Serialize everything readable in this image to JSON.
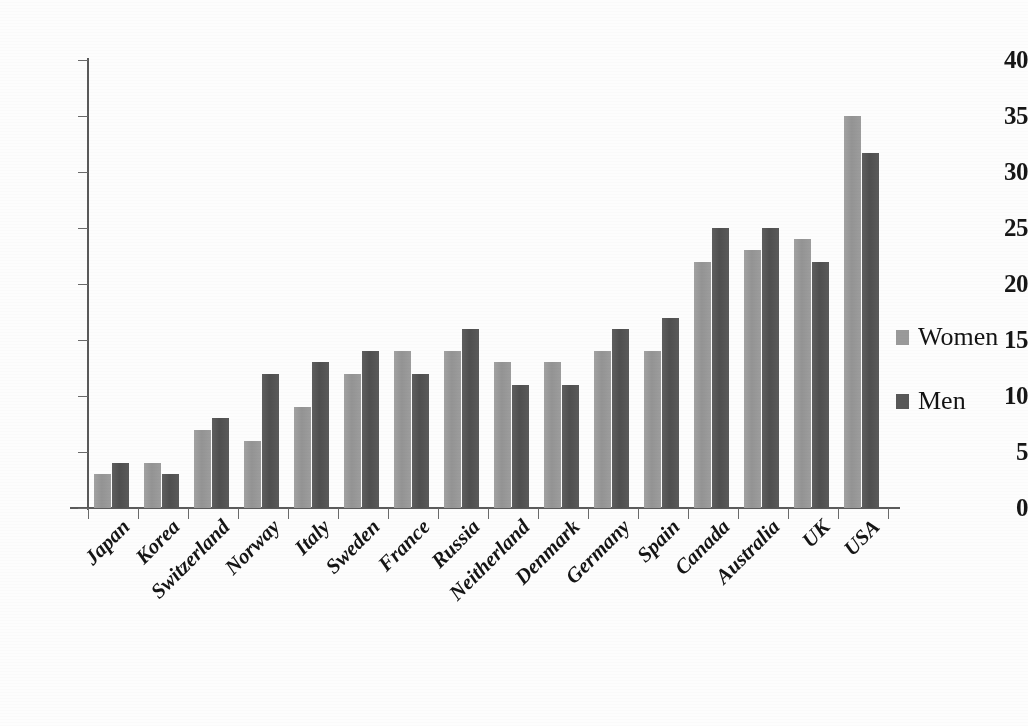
{
  "chart_data": {
    "type": "bar",
    "title": "",
    "subtitle": "",
    "xlabel": "",
    "ylabel": "",
    "ylim": [
      0,
      40
    ],
    "ytick_step": 5,
    "yticks": [
      "40",
      "35",
      "30",
      "25",
      "20",
      "15",
      "10",
      "5",
      "0"
    ],
    "grid": false,
    "legend_position": "right",
    "categories": [
      "Japan",
      "Korea",
      "Switzerland",
      "Norway",
      "Italy",
      "Sweden",
      "France",
      "Russia",
      "Neitherland",
      "Denmark",
      "Germany",
      "Spain",
      "Canada",
      "Australia",
      "UK",
      "USA"
    ],
    "series": [
      {
        "name": "Women",
        "color": "#9a9a9a",
        "values": [
          3,
          4,
          7,
          6,
          9,
          12,
          14,
          14,
          13,
          13,
          14,
          14,
          22,
          23,
          24,
          35
        ]
      },
      {
        "name": "Men",
        "color": "#585858",
        "values": [
          4,
          3,
          8,
          12,
          13,
          14,
          12,
          16,
          11,
          11,
          16,
          17,
          25,
          25,
          22,
          31.7
        ]
      }
    ]
  },
  "legend": {
    "items": [
      {
        "label": "Women",
        "color": "#9a9a9a"
      },
      {
        "label": "Men",
        "color": "#585858"
      }
    ]
  },
  "colors": {
    "women_bar": "#9a9a9a",
    "men_bar": "#585858",
    "axis": "#5a5a5a",
    "text": "#151515",
    "background": "#fdfdfd"
  }
}
